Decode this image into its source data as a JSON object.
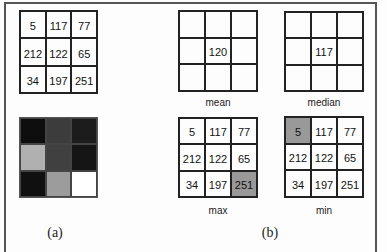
{
  "input_matrix": {
    "values": [
      [
        5,
        117,
        77
      ],
      [
        212,
        122,
        65
      ],
      [
        34,
        197,
        251
      ]
    ]
  },
  "grayscale_image": {
    "colors": [
      [
        "#0e0e0e",
        "#3c3c3c",
        "#1c1c1c"
      ],
      [
        "#b0b0b0",
        "#404040",
        "#151515"
      ],
      [
        "#101010",
        "#9c9c9c",
        "#ffffff"
      ]
    ]
  },
  "mean": {
    "label": "mean",
    "values": [
      [
        "",
        "",
        ""
      ],
      [
        "",
        "120",
        ""
      ],
      [
        "",
        "",
        ""
      ]
    ]
  },
  "median": {
    "label": "median",
    "values": [
      [
        "",
        "",
        ""
      ],
      [
        "",
        "117",
        ""
      ],
      [
        "",
        "",
        ""
      ]
    ]
  },
  "max": {
    "label": "max",
    "values": [
      [
        "5",
        "117",
        "77"
      ],
      [
        "212",
        "122",
        "65"
      ],
      [
        "34",
        "197",
        "251"
      ]
    ],
    "highlight": [
      2,
      2
    ],
    "highlight_color": "#999999"
  },
  "min": {
    "label": "min",
    "values": [
      [
        "5",
        "117",
        "77"
      ],
      [
        "212",
        "122",
        "65"
      ],
      [
        "34",
        "197",
        "251"
      ]
    ],
    "highlight": [
      0,
      0
    ],
    "highlight_color": "#999999"
  },
  "captions": {
    "a": "(a)",
    "b": "(b)"
  }
}
